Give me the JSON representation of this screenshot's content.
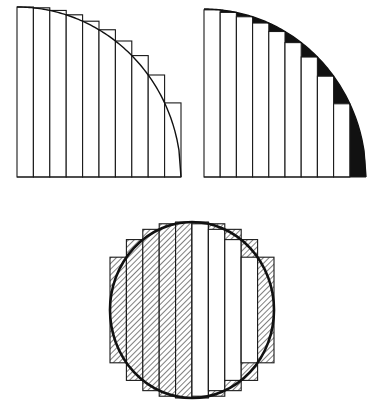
{
  "figures": [
    {
      "id": "circumscribed-quarter",
      "description": "Quarter circle approximated by 10 circumscribed rectangles; excess shown black",
      "type": "quarter-circle-upper-sum",
      "strip_count": 10,
      "x0": 17,
      "x1": 181,
      "baseline_y": 177,
      "top_y": 7,
      "fill_excess": "#111111"
    },
    {
      "id": "inscribed-quarter",
      "description": "Quarter circle approximated by 10 inscribed rectangles; deficit shown black",
      "type": "quarter-circle-lower-sum",
      "strip_count": 10,
      "x0": 204,
      "x1": 366,
      "baseline_y": 177,
      "top_y": 9,
      "fill_deficit": "#111111"
    },
    {
      "id": "hatched-circle",
      "description": "Full circle with 10 vertical strips; left half circumscribed, right half inscribed; hatched regions",
      "type": "circle-strips",
      "strip_count": 10,
      "cx": 192,
      "cy": 310,
      "rx": 82,
      "ry": 88,
      "hatch_color": "#444444"
    }
  ]
}
